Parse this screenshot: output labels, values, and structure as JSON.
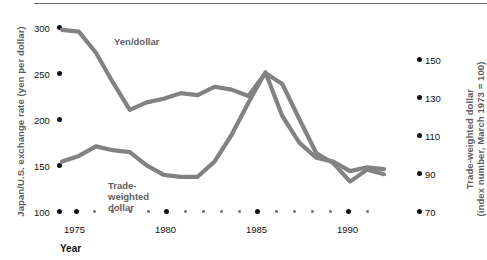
{
  "chart_data": {
    "type": "line",
    "title": "",
    "xlabel": "Year",
    "grid": false,
    "legend_position": "inline-annotation",
    "x": [
      1973,
      1974,
      1975,
      1976,
      1977,
      1978,
      1979,
      1980,
      1981,
      1982,
      1983,
      1984,
      1985,
      1986,
      1987,
      1988,
      1989,
      1990,
      1991,
      1992
    ],
    "xlim": [
      1973,
      1992
    ],
    "xticks_major": [
      1975,
      1980,
      1985,
      1990
    ],
    "xtick_labels": [
      "1975",
      "1980",
      "1985",
      "1990"
    ],
    "axes": {
      "left": {
        "label": "Japan/U.S. exchange rate (yen per dollar)",
        "ticks": [
          100,
          150,
          200,
          250,
          300
        ],
        "tick_labels": [
          "100",
          "150",
          "200",
          "250",
          "300"
        ],
        "ylim": [
          100,
          300
        ]
      },
      "right": {
        "label_line1": "Trade-weighted dollar",
        "label_line2": "(index number, March 1973 = 100)",
        "ticks": [
          70,
          90,
          110,
          130,
          150
        ],
        "tick_labels": [
          "70",
          "90",
          "110",
          "130",
          "150"
        ],
        "ylim": [
          70,
          150
        ]
      }
    },
    "series": [
      {
        "name": "Yen/dollar",
        "axis": "left",
        "color": "#828282",
        "label_lines": [
          "Yen/dollar"
        ],
        "values": [
          297,
          295,
          272,
          240,
          210,
          218,
          222,
          228,
          226,
          235,
          232,
          225,
          250,
          238,
          200,
          163,
          152,
          132,
          145,
          140
        ]
      },
      {
        "name": "Trade-weighted dollar",
        "axis": "right",
        "color": "#828282",
        "label_lines": [
          "Trade-",
          "weighted",
          "dollar"
        ],
        "values": [
          96,
          99,
          104,
          102,
          101,
          94,
          89,
          88,
          88,
          96,
          110,
          127,
          143,
          120,
          106,
          98,
          96,
          91,
          93,
          92
        ]
      }
    ]
  },
  "figure": {
    "xtitle": "Year",
    "left_axis_title": "Japan/U.S. exchange rate (yen per dollar)",
    "right_axis_title_l1": "Trade-weighted dollar",
    "right_axis_title_l2": "(index number, March 1973 = 100)",
    "left_ticks": [
      "300",
      "250",
      "200",
      "150",
      "100"
    ],
    "right_ticks": [
      "150",
      "130",
      "110",
      "90",
      "70"
    ],
    "x_ticks": [
      "1975",
      "1980",
      "1985",
      "1990"
    ],
    "series_label_yen": "Yen/dollar",
    "series_label_twd_1": "Trade-",
    "series_label_twd_2": "weighted",
    "series_label_twd_3": "dollar",
    "colors": {
      "line": "#828282",
      "text": "#111111",
      "muted_text": "#5e5e5e",
      "rule": "#6e6e6e",
      "background": "#ffffff"
    }
  }
}
